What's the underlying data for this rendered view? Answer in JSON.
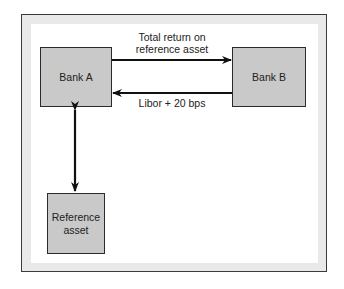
{
  "diagram": {
    "nodes": {
      "bank_a": "Bank A",
      "bank_b": "Bank B",
      "reference_asset": "Reference asset"
    },
    "edges": {
      "top_label_line1": "Total return on",
      "top_label_line2": "reference asset",
      "bottom_label": "Libor + 20 bps"
    },
    "colors": {
      "box_fill": "#c9c9c9",
      "frame_band": "#e9e9e9",
      "stroke": "#111111"
    }
  }
}
